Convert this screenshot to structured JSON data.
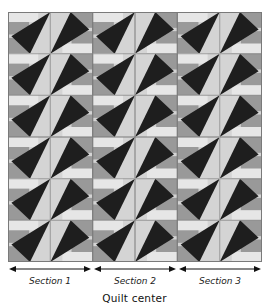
{
  "diagram": {
    "caption": "Quilt center",
    "grid": {
      "columns": 6,
      "rows": 6
    },
    "colors": {
      "dark": "#1e1e1e",
      "light": "#d4d4d4",
      "medium": "#999999",
      "pale": "#e6e6e6",
      "seam": "#7a7a7a"
    },
    "sections": [
      {
        "label": "Section 1"
      },
      {
        "label": "Section 2"
      },
      {
        "label": "Section 3"
      }
    ]
  }
}
